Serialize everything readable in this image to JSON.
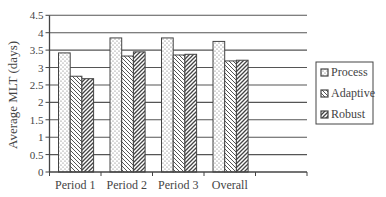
{
  "chart_data": {
    "type": "bar",
    "title": "",
    "xlabel": "",
    "ylabel": "Average MLT (days)",
    "ylim": [
      0,
      4.5
    ],
    "yticks": [
      0,
      0.5,
      1,
      1.5,
      2,
      2.5,
      3,
      3.5,
      4,
      4.5
    ],
    "ytick_labels": [
      "0",
      "0.5",
      "1",
      "1.5",
      "2",
      "2.5",
      "3",
      "3.5",
      "4",
      "4.5"
    ],
    "grid": true,
    "legend_position": "right",
    "categories": [
      "Period 1",
      "Period 2",
      "Period 3",
      "Overall"
    ],
    "series": [
      {
        "name": "Process",
        "pattern": "dots",
        "values": [
          3.42,
          3.85,
          3.85,
          3.75
        ]
      },
      {
        "name": "Adaptive",
        "pattern": "back-diagonal",
        "values": [
          2.75,
          3.33,
          3.36,
          3.19
        ]
      },
      {
        "name": "Robust",
        "pattern": "forward-diagonal",
        "values": [
          2.68,
          3.45,
          3.38,
          3.21
        ]
      }
    ]
  },
  "colors": {
    "axis": "#444444",
    "gridline": "#555555",
    "bar_outline": "#444444",
    "pattern": "#555555"
  }
}
